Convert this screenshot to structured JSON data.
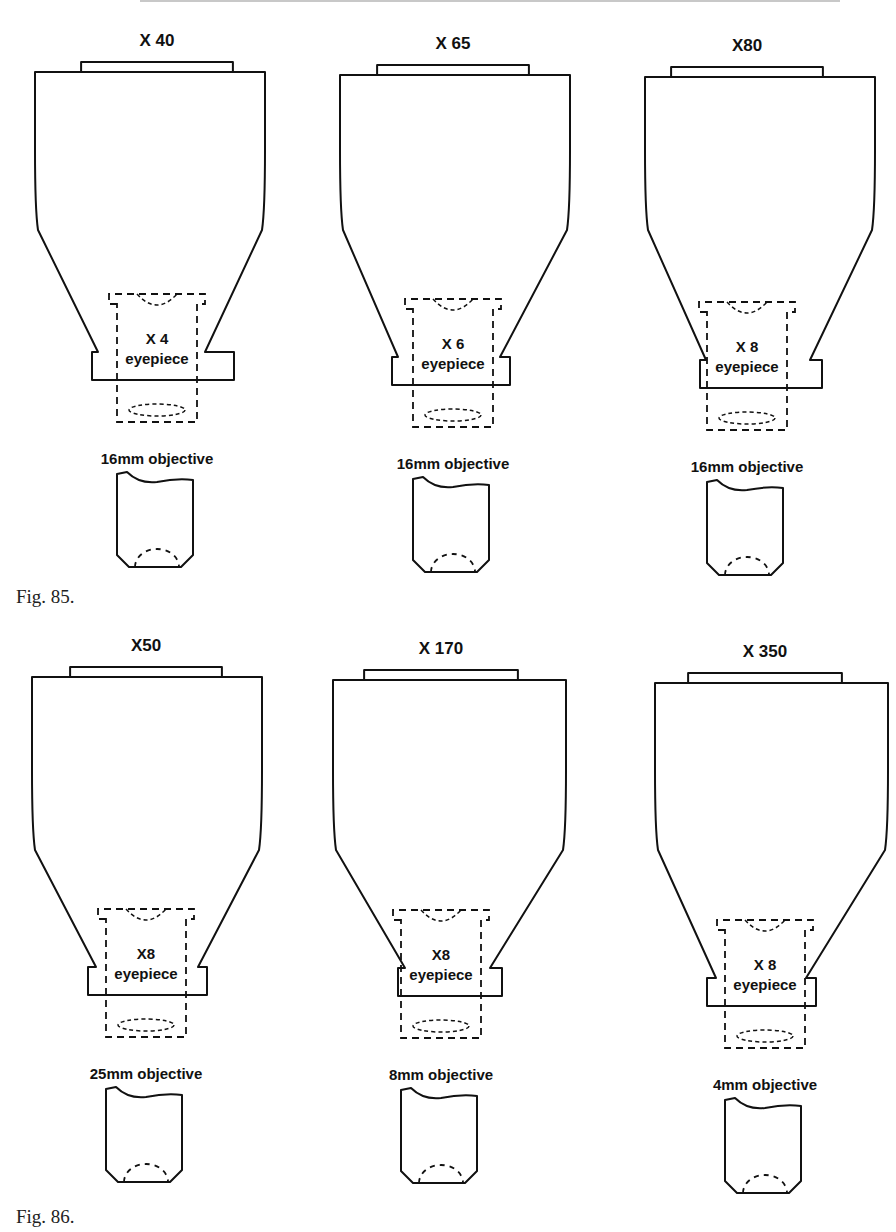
{
  "figures": [
    {
      "label": "Fig. 85.",
      "panels": [
        {
          "magnification": "X 40",
          "eyepiece_power": "X 4",
          "eyepiece_label": "eyepiece",
          "objective_label": "16mm objective"
        },
        {
          "magnification": "X 65",
          "eyepiece_power": "X 6",
          "eyepiece_label": "eyepiece",
          "objective_label": "16mm objective"
        },
        {
          "magnification": "X80",
          "eyepiece_power": "X 8",
          "eyepiece_label": "eyepiece",
          "objective_label": "16mm objective"
        }
      ]
    },
    {
      "label": "Fig. 86.",
      "panels": [
        {
          "magnification": "X50",
          "eyepiece_power": "X8",
          "eyepiece_label": "eyepiece",
          "objective_label": "25mm objective"
        },
        {
          "magnification": "X 170",
          "eyepiece_power": "X8",
          "eyepiece_label": "eyepiece",
          "objective_label": "8mm objective"
        },
        {
          "magnification": "X 350",
          "eyepiece_power": "X 8",
          "eyepiece_label": "eyepiece",
          "objective_label": "4mm objective"
        }
      ]
    }
  ]
}
